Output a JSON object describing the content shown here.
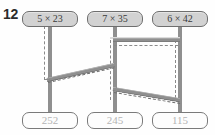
{
  "problem": {
    "number": "12"
  },
  "top_nodes": [
    {
      "id": "top-node-1",
      "label": "5 × 42",
      "factor_a": "5",
      "operator": "×",
      "factor_b": "23",
      "display": "5 × 23",
      "x": 22,
      "y": 11,
      "w": 56
    },
    {
      "id": "top-node-2",
      "label": "7 × 35",
      "factor_a": "7",
      "operator": "×",
      "factor_b": "35",
      "display": "7 × 35",
      "x": 87,
      "y": 11,
      "w": 56
    },
    {
      "id": "top-node-3",
      "label": "6 × 42",
      "factor_a": "6",
      "operator": "×",
      "factor_b": "42",
      "display": "6 × 42",
      "x": 152,
      "y": 11,
      "w": 56
    }
  ],
  "bottom_nodes": [
    {
      "id": "bottom-node-1",
      "value": "252",
      "x": 22,
      "y": 112,
      "w": 56
    },
    {
      "id": "bottom-node-2",
      "value": "245",
      "x": 87,
      "y": 112,
      "w": 56
    },
    {
      "id": "bottom-node-3",
      "value": "115",
      "x": 152,
      "y": 112,
      "w": 56
    }
  ],
  "colors": {
    "beam": "#8f8f8f",
    "beam_highlight": "#bdbdbd",
    "beam_shadow": "#6a6a6a",
    "top_box_fill": "#d2d2d2",
    "top_box_border": "#6e6e6e",
    "bottom_box_fill": "#fdfdfd",
    "bottom_box_border": "#7a7a7a",
    "bottom_text": "#b4b4b4",
    "number_text": "#2b2b2b",
    "background": "#ffffff"
  },
  "connectors": {
    "description": "thick grey beams linking multiplication expression boxes to answer boxes",
    "count": 3
  }
}
